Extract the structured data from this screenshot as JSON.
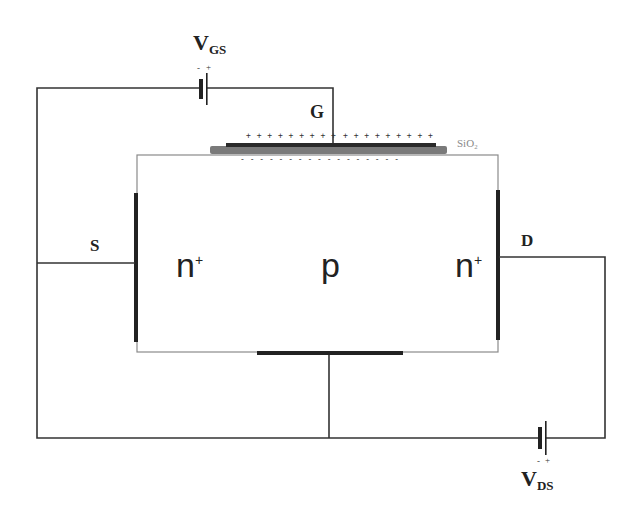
{
  "diagram": {
    "type": "nMOSFET cross-section circuit",
    "colors": {
      "wire": "#333333",
      "contact": "#222222",
      "oxide": "#7a7a7a",
      "gate_metal": "#2a2a2a",
      "substrate_border": "#888888",
      "oxide_label": "#8a8a8a"
    },
    "sources": {
      "vgs": {
        "main": "V",
        "sub": "GS",
        "polarity_minus": "-",
        "polarity_plus": "+"
      },
      "vds": {
        "main": "V",
        "sub": "DS",
        "polarity_minus": "-",
        "polarity_plus": "+"
      }
    },
    "terminals": {
      "gate": "G",
      "source": "S",
      "drain": "D"
    },
    "regions": {
      "source_region": {
        "main": "n",
        "sup": "+"
      },
      "body_region": {
        "main": "p"
      },
      "drain_region": {
        "main": "n",
        "sup": "+"
      }
    },
    "oxide_label": "SiO₂",
    "gate_charges_left": "+ + + + + + + + +",
    "gate_charges_right": "+ + + + + + + + +",
    "channel_charges": "- - - - - - - - - - - - - - - - -"
  }
}
